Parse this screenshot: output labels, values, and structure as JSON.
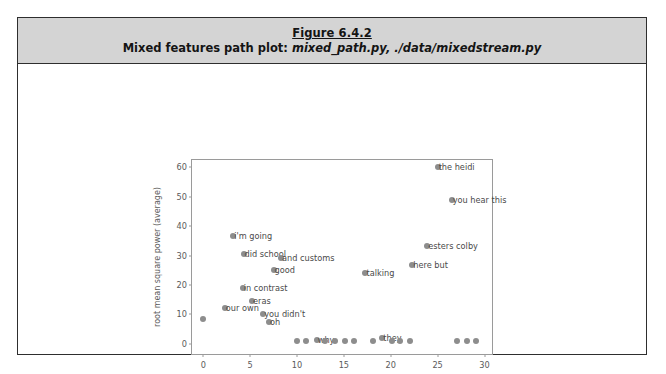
{
  "figure": {
    "title": "Figure 6.4.2",
    "subtitle_prefix": "Mixed features path plot:",
    "subtitle_files": "mixed_path.py, ./data/mixedstream.py"
  },
  "chart_data": {
    "type": "scatter",
    "title": "",
    "xlabel": "time (seconds)",
    "ylabel": "root mean square power (average)",
    "xlim": [
      -1.2,
      30.8
    ],
    "ylim": [
      -3.5,
      62.5
    ],
    "xticks": [
      0,
      5,
      10,
      15,
      20,
      25,
      30
    ],
    "yticks": [
      0,
      10,
      20,
      30,
      40,
      50,
      60
    ],
    "grid": false,
    "legend": "none",
    "marker_color": "#8d8d8d",
    "label_color": "#4a4a4a",
    "points": [
      {
        "x": 0.0,
        "y": 8.3,
        "label": ""
      },
      {
        "x": 2.3,
        "y": 12.0,
        "label": "our own"
      },
      {
        "x": 3.2,
        "y": 36.5,
        "label": "i'm going"
      },
      {
        "x": 4.2,
        "y": 19.0,
        "label": "in contrast"
      },
      {
        "x": 4.3,
        "y": 30.5,
        "label": "did school"
      },
      {
        "x": 5.2,
        "y": 14.5,
        "label": "eras"
      },
      {
        "x": 6.4,
        "y": 10.0,
        "label": "you didn't"
      },
      {
        "x": 7.0,
        "y": 7.4,
        "label": "oh"
      },
      {
        "x": 7.5,
        "y": 25.2,
        "label": "good"
      },
      {
        "x": 8.3,
        "y": 29.0,
        "label": "and customs"
      },
      {
        "x": 10.0,
        "y": 1.0,
        "label": ""
      },
      {
        "x": 11.0,
        "y": 1.0,
        "label": ""
      },
      {
        "x": 12.1,
        "y": 1.2,
        "label": "why"
      },
      {
        "x": 13.0,
        "y": 1.0,
        "label": ""
      },
      {
        "x": 14.0,
        "y": 1.0,
        "label": ""
      },
      {
        "x": 15.1,
        "y": 1.0,
        "label": ""
      },
      {
        "x": 16.1,
        "y": 1.0,
        "label": ""
      },
      {
        "x": 17.3,
        "y": 24.0,
        "label": "talking"
      },
      {
        "x": 18.1,
        "y": 1.0,
        "label": ""
      },
      {
        "x": 19.1,
        "y": 2.0,
        "label": "they"
      },
      {
        "x": 20.1,
        "y": 1.0,
        "label": ""
      },
      {
        "x": 21.0,
        "y": 1.0,
        "label": ""
      },
      {
        "x": 22.0,
        "y": 1.0,
        "label": ""
      },
      {
        "x": 22.3,
        "y": 26.8,
        "label": "here but"
      },
      {
        "x": 23.9,
        "y": 33.2,
        "label": "esters colby"
      },
      {
        "x": 25.0,
        "y": 60.0,
        "label": "the heidi"
      },
      {
        "x": 26.5,
        "y": 49.0,
        "label": "you hear this"
      },
      {
        "x": 27.1,
        "y": 1.0,
        "label": ""
      },
      {
        "x": 28.1,
        "y": 1.0,
        "label": ""
      },
      {
        "x": 29.1,
        "y": 1.0,
        "label": ""
      }
    ]
  }
}
